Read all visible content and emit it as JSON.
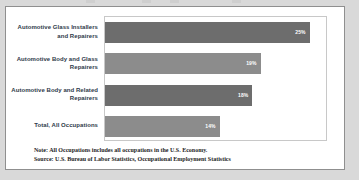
{
  "chart_data": {
    "type": "bar",
    "orientation": "horizontal",
    "title": "",
    "xlabel": "",
    "ylabel": "",
    "xlim": [
      0,
      27
    ],
    "grid": false,
    "legend_position": "none",
    "categories": [
      "Automotive Glass Installers and Repairers",
      "Automotive Body and Glass Repairers",
      "Automotive Body and Related Repairers",
      "Total, All Occupations"
    ],
    "values": [
      25,
      19,
      18,
      14
    ],
    "value_labels": [
      "25%",
      "19%",
      "18%",
      "14%"
    ],
    "bar_colors": [
      "#6d6d6d",
      "#8c8c8c",
      "#6d6d6d",
      "#8c8c8c"
    ],
    "annotations": [
      "Note: All Occupations includes all occupations in the U.S. Economy.",
      "Source: U.S. Bureau of Labor Statistics, Occupational Employment Statistics"
    ]
  },
  "footnotes": {
    "note": "Note: All Occupations includes all occupations in the U.S. Economy.",
    "source": "Source: U.S. Bureau of Labor Statistics, Occupational Employment Statistics"
  }
}
